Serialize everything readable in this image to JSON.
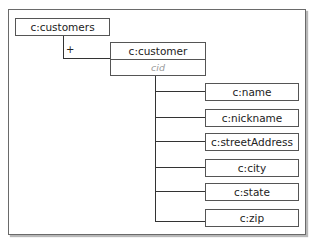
{
  "diagram": {
    "root": {
      "label": "c:customers"
    },
    "connector_symbol": "+",
    "element": {
      "label": "c:customer",
      "attribute": "cid"
    },
    "children": [
      {
        "label": "c:name"
      },
      {
        "label": "c:nickname"
      },
      {
        "label": "c:streetAddress"
      },
      {
        "label": "c:city"
      },
      {
        "label": "c:state"
      },
      {
        "label": "c:zip"
      }
    ]
  }
}
